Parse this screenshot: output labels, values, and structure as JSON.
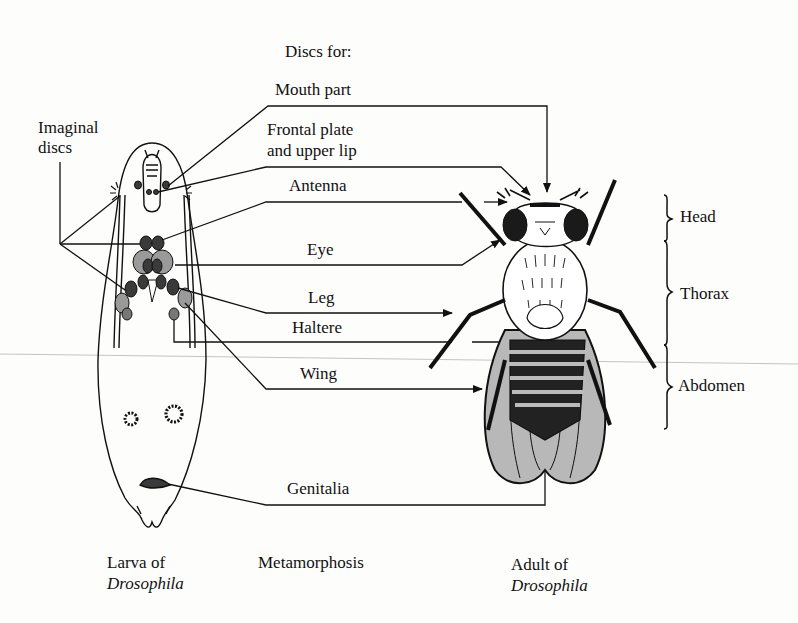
{
  "diagram": {
    "header": "Discs for:",
    "imaginal_label": [
      "Imaginal",
      "discs"
    ],
    "disc_labels": [
      {
        "id": "mouth",
        "lines": [
          "Mouth part"
        ]
      },
      {
        "id": "frontal",
        "lines": [
          "Frontal plate",
          "and upper lip"
        ]
      },
      {
        "id": "antenna",
        "lines": [
          "Antenna"
        ]
      },
      {
        "id": "eye",
        "lines": [
          "Eye"
        ]
      },
      {
        "id": "leg",
        "lines": [
          "Leg"
        ]
      },
      {
        "id": "haltere",
        "lines": [
          "Haltere"
        ]
      },
      {
        "id": "wing",
        "lines": [
          "Wing"
        ]
      },
      {
        "id": "genitalia",
        "lines": [
          "Genitalia"
        ]
      }
    ],
    "body_regions": [
      "Head",
      "Thorax",
      "Abdomen"
    ],
    "captions": {
      "larva": {
        "line1": "Larva of",
        "line2": "Drosophila"
      },
      "middle": "Metamorphosis",
      "adult": {
        "line1": "Adult of",
        "line2": "Drosophila"
      }
    },
    "colors": {
      "ink": "#111111",
      "disc_dark": "#3a3a3a",
      "disc_light": "#9a9a9a",
      "wing_fill": "#b8b8b8",
      "paper": "#fdfdfc",
      "scan_line": "#bdbdbd"
    }
  }
}
